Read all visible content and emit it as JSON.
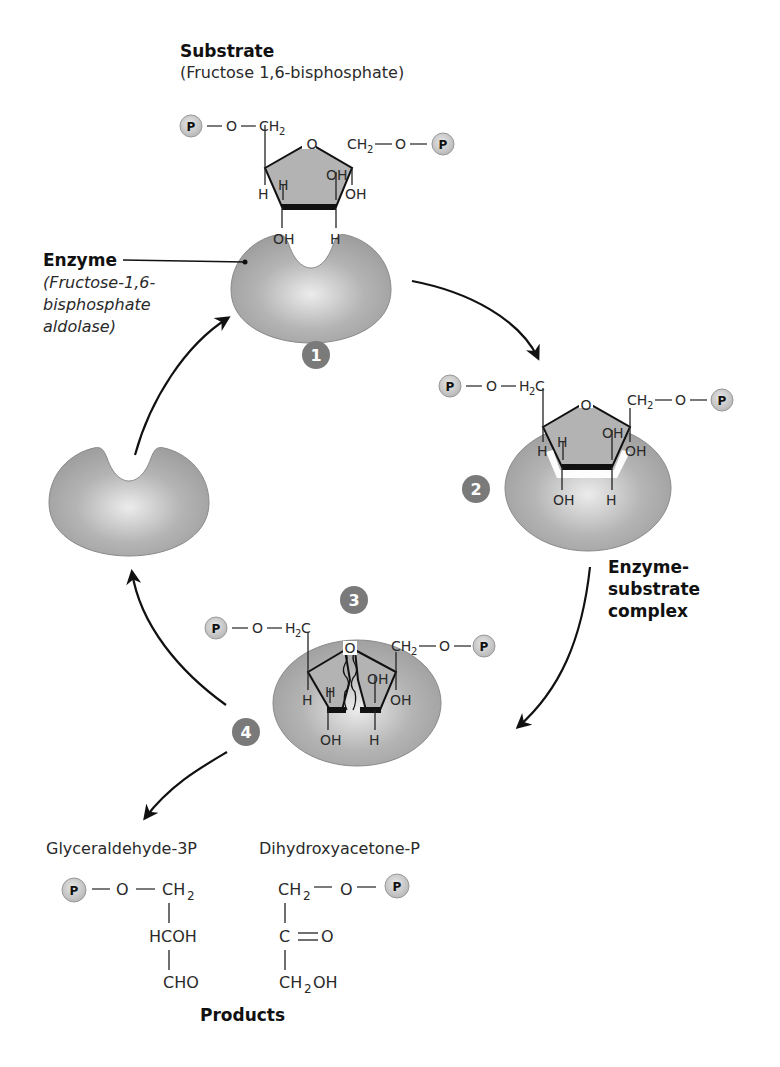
{
  "substrate": {
    "heading": "Substrate",
    "name": "(Fructose 1,6-bisphosphate)",
    "left_chain": [
      "P",
      "O",
      "CH",
      "2"
    ],
    "right_chain": [
      "CH",
      "2",
      "O",
      "P"
    ],
    "ring_oxygen": "O",
    "ring_labels": [
      "H",
      "H",
      "OH",
      "OH",
      "OH",
      "H"
    ]
  },
  "enzyme": {
    "heading": "Enzyme",
    "name_line1": "(Fructose-1,6-",
    "name_line2": "bisphosphate",
    "name_line3": "aldolase)"
  },
  "steps": [
    {
      "number": "1"
    },
    {
      "number": "2"
    },
    {
      "number": "3"
    },
    {
      "number": "4"
    }
  ],
  "complex": {
    "label_line1": "Enzyme-",
    "label_line2": "substrate",
    "label_line3": "complex",
    "left_chain": [
      "P",
      "O",
      "H",
      "2",
      "C"
    ],
    "right_chain": [
      "CH",
      "2",
      "O",
      "P"
    ]
  },
  "products": {
    "heading": "Products",
    "glyceraldehyde": {
      "name": "Glyceraldehyde-3P",
      "row1": [
        "P",
        "O",
        "CH",
        "2"
      ],
      "row2": "HCOH",
      "row3": "CHO"
    },
    "dihydroxyacetone": {
      "name": "Dihydroxyacetone-P",
      "row1": [
        "CH",
        "2",
        "O",
        "P"
      ],
      "row2": [
        "C",
        "O"
      ],
      "row3": [
        "CH",
        "2",
        "OH"
      ]
    }
  },
  "atoms": {
    "P": "P",
    "O": "O",
    "H": "H",
    "OH": "OH",
    "CH": "CH",
    "sub2": "2",
    "C": "C"
  },
  "colors": {
    "enzyme_fill": "#a8a8a8",
    "enzyme_highlight": "#e6e6e6",
    "ring_fill": "#b3b3b3",
    "phosphate_fill": "#d0d0d0",
    "step_badge": "#7a7a7a",
    "arrow": "#111111",
    "text": "#2a2a2a"
  }
}
